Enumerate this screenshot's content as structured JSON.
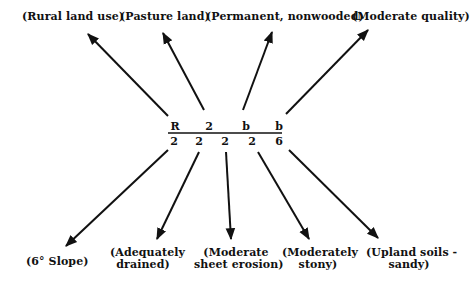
{
  "diagram": {
    "formula": {
      "numerators": [
        "R",
        "2",
        "b",
        "b"
      ],
      "denominators": [
        "2",
        "2",
        "2",
        "2",
        "6"
      ]
    },
    "top_labels": [
      {
        "text": "(Rural land use)"
      },
      {
        "text": "(Pasture land)"
      },
      {
        "text": "(Permanent, nonwooded)"
      },
      {
        "text": "(Moderate quality)"
      }
    ],
    "bottom_labels": [
      {
        "line1": "(6° Slope)",
        "line2": ""
      },
      {
        "line1": "(Adequately",
        "line2": "drained)"
      },
      {
        "line1": "(Moderate",
        "line2": "sheet erosion)"
      },
      {
        "line1": "(Moderately",
        "line2": "stony)"
      },
      {
        "line1": "(Upland soils -",
        "line2": "sandy)"
      }
    ],
    "colors": {
      "ink": "#111111",
      "background": "#ffffff"
    }
  }
}
